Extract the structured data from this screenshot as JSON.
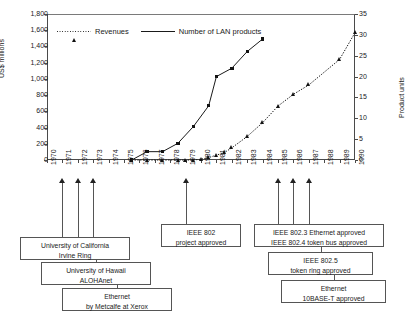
{
  "chart_data": {
    "type": "line",
    "title": "",
    "xlabel": "",
    "ylabel": "US$ millions",
    "y2label": "Product units",
    "ylim": [
      0,
      1800
    ],
    "y2lim": [
      0,
      35
    ],
    "grid": false,
    "legend_position": "top-left-inside",
    "x": [
      1970,
      1971,
      1972,
      1973,
      1974,
      1975,
      1976,
      1977,
      1978,
      1979,
      1980,
      1981,
      1982,
      1983,
      1984,
      1985,
      1986,
      1987,
      1988,
      1989,
      1990
    ],
    "y_ticks_left": [
      "0",
      "200",
      "400",
      "600",
      "800",
      "1,000",
      "1,200",
      "1,400",
      "1,600",
      "1,800"
    ],
    "y_ticks_right": [
      "0",
      "5",
      "10",
      "15",
      "20",
      "25",
      "30",
      "35"
    ],
    "x_tick_labels": [
      "1970",
      "1971",
      "1972",
      "1973",
      "1974",
      "1975",
      "1976",
      "1977",
      "1978",
      "1979",
      "1980",
      "1981",
      "1982",
      "1983",
      "1984",
      "1985",
      "1986",
      "1987",
      "1988",
      "1989",
      "1990"
    ],
    "series": [
      {
        "name": "Revenues",
        "axis": "left",
        "unit": "US$ millions",
        "marker": "triangle",
        "line_style": "dotted",
        "points": [
          {
            "x": 1975.5,
            "y": 0
          },
          {
            "x": 1976.5,
            "y": 0
          },
          {
            "x": 1977.5,
            "y": 0
          },
          {
            "x": 1978.5,
            "y": 0
          },
          {
            "x": 1979.0,
            "y": 0
          },
          {
            "x": 1979.5,
            "y": 0
          },
          {
            "x": 1980.0,
            "y": 10
          },
          {
            "x": 1980.5,
            "y": 30
          },
          {
            "x": 1981.0,
            "y": 60
          },
          {
            "x": 1981.5,
            "y": 90
          },
          {
            "x": 1982.0,
            "y": 150
          },
          {
            "x": 1983.0,
            "y": 290
          },
          {
            "x": 1984.0,
            "y": 460
          },
          {
            "x": 1985.0,
            "y": 665
          },
          {
            "x": 1986.0,
            "y": 810
          },
          {
            "x": 1987.0,
            "y": 925
          },
          {
            "x": 1989.0,
            "y": 1240
          },
          {
            "x": 1990.0,
            "y": 1570
          }
        ]
      },
      {
        "name": "Number of LAN products",
        "axis": "right",
        "unit": "Product units",
        "marker": "square",
        "line_style": "solid",
        "points": [
          {
            "x": 1975.5,
            "y": 0
          },
          {
            "x": 1976.5,
            "y": 2
          },
          {
            "x": 1977.5,
            "y": 2
          },
          {
            "x": 1978.5,
            "y": 4
          },
          {
            "x": 1979.5,
            "y": 8
          },
          {
            "x": 1980.5,
            "y": 13
          },
          {
            "x": 1981.0,
            "y": 20
          },
          {
            "x": 1982.0,
            "y": 22
          },
          {
            "x": 1983.0,
            "y": 26
          },
          {
            "x": 1984.0,
            "y": 29
          }
        ]
      }
    ]
  },
  "annotations": {
    "groups": [
      {
        "id": "left-group",
        "arrow_years": [
          "1971",
          "1972",
          "1973"
        ],
        "boxes": [
          {
            "id": "uc-irvine-ring",
            "lines": [
              "University of California",
              "Irvine Ring"
            ]
          },
          {
            "id": "hawaii-alohanet",
            "lines": [
              "University of Hawaii",
              "ALOHAnet"
            ]
          },
          {
            "id": "ethernet-metcalfe",
            "lines": [
              "Ethernet",
              "by Metcalfe at Xerox"
            ]
          }
        ]
      },
      {
        "id": "ieee802-group",
        "arrow_years": [
          "1979"
        ],
        "boxes": [
          {
            "id": "ieee-802-project",
            "lines": [
              "IEEE 802",
              "project approved"
            ]
          }
        ]
      },
      {
        "id": "right-group",
        "arrow_years": [
          "1985",
          "1986",
          "1987"
        ],
        "boxes": [
          {
            "id": "ieee-8023-8024",
            "lines": [
              "IEEE 802.3 Ethernet approved",
              "IEEE 802.4 token bus approved"
            ]
          },
          {
            "id": "ieee-8025-token-ring",
            "lines": [
              "IEEE 802.5",
              "token ring approved"
            ]
          },
          {
            "id": "ethernet-10baset",
            "lines": [
              "Ethernet",
              "10BASE-T approved"
            ]
          }
        ]
      }
    ]
  },
  "colors": {
    "line": "#1a1a1a",
    "axis": "#4a4a4a",
    "box_border": "#555555",
    "background": "#ffffff"
  }
}
